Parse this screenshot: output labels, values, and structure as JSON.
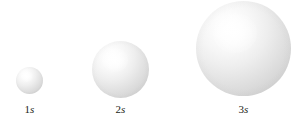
{
  "figure": {
    "background_color": "#ffffff",
    "label_color": "#231f20",
    "sphere_highlight_color": "#ffffff",
    "sphere_midtone_color": "#e4e4e4",
    "sphere_edge_color": "#c0c0c0"
  },
  "orbitals": [
    {
      "id": "1s",
      "principal_quantum_number": "1",
      "orbital_type": "s",
      "label": "1s",
      "diameter_px": 27,
      "center_x_px": 29,
      "center_y_px": 80
    },
    {
      "id": "2s",
      "principal_quantum_number": "2",
      "orbital_type": "s",
      "label": "2s",
      "diameter_px": 57,
      "center_x_px": 120,
      "center_y_px": 69
    },
    {
      "id": "3s",
      "principal_quantum_number": "3",
      "orbital_type": "s",
      "label": "3s",
      "diameter_px": 95,
      "center_x_px": 243,
      "center_y_px": 48
    }
  ]
}
